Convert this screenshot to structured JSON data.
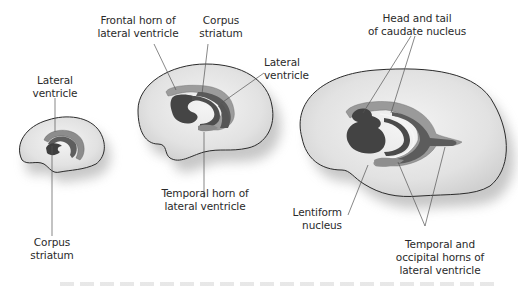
{
  "figure": {
    "colors": {
      "outline": "#2b2b2b",
      "brain_fill": "#e4e4e4",
      "brain_fill_center": "#f2f2f2",
      "shadow": "#b8b8b8",
      "ventricle_light": "#9a9a9a",
      "ventricle_dark": "#5e5e5e",
      "nucleus": "#4a4a4a",
      "leader_line": "#555555"
    },
    "stages": [
      {
        "id": "small",
        "labels": [
          {
            "lines": [
              "Lateral",
              "ventricle"
            ]
          },
          {
            "lines": [
              "Corpus",
              "striatum"
            ]
          }
        ]
      },
      {
        "id": "medium",
        "labels": [
          {
            "lines": [
              "Frontal horn of",
              "lateral ventricle"
            ]
          },
          {
            "lines": [
              "Corpus",
              "striatum"
            ]
          },
          {
            "lines": [
              "Lateral",
              "ventricle"
            ]
          },
          {
            "lines": [
              "Temporal horn of",
              "lateral ventricle"
            ]
          }
        ]
      },
      {
        "id": "large",
        "labels": [
          {
            "lines": [
              "Head and tail",
              "of caudate nucleus"
            ]
          },
          {
            "lines": [
              "Lentiform",
              "nucleus"
            ]
          },
          {
            "lines": [
              "Temporal and",
              "occipital horns of",
              "lateral ventricle"
            ]
          }
        ]
      }
    ]
  }
}
